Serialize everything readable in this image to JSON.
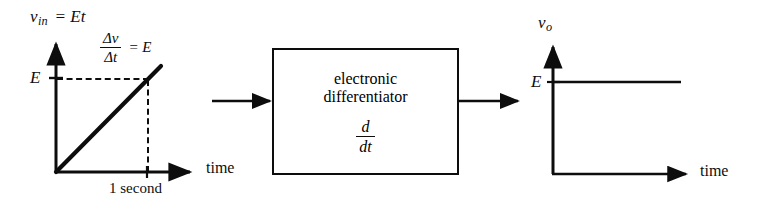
{
  "figure": {
    "background_color": "#ffffff",
    "ink_color": "#0d0d0d"
  },
  "input_plot": {
    "name": "input-waveform-plot",
    "signal_label_v": "v",
    "signal_label_sub": "in",
    "signal_label_eq": "=  Et",
    "y_tick_label": "E",
    "x_axis_label": "time",
    "x_tick_label": "1 second",
    "slope_annotation": {
      "numerator": "Δv",
      "denominator": "Δt",
      "equals": "=  E"
    },
    "waveform": "linear ramp from origin with slope E"
  },
  "block": {
    "name": "electronic-differentiator-block",
    "line1": "electronic",
    "line2": "differentiator",
    "operator_numerator": "d",
    "operator_denominator": "dt",
    "input_arrow": "input-signal-arrow",
    "output_arrow": "output-signal-arrow"
  },
  "output_plot": {
    "name": "output-waveform-plot",
    "signal_label_v": "v",
    "signal_label_sub": "o",
    "y_tick_label": "E",
    "x_axis_label": "time",
    "waveform": "constant level at E"
  }
}
